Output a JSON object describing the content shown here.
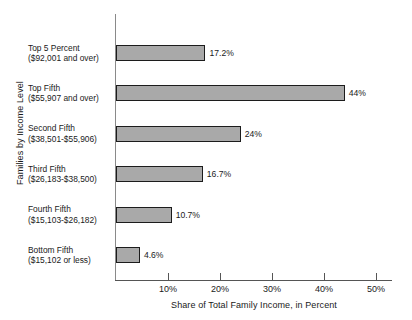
{
  "chart_data": {
    "type": "bar",
    "orientation": "horizontal",
    "title": "",
    "xlabel": "Share of Total Family Income, in Percent",
    "ylabel": "Families by Income Level",
    "xlim": [
      0,
      53
    ],
    "grid": false,
    "legend": "none",
    "xticks": [
      {
        "value": 10,
        "label": "10%"
      },
      {
        "value": 20,
        "label": "20%"
      },
      {
        "value": 30,
        "label": "30%"
      },
      {
        "value": 40,
        "label": "40%"
      },
      {
        "value": 50,
        "label": "50%"
      }
    ],
    "bar_color": "#a9a9a9",
    "bar_border_color": "#1c1c1c",
    "categories": [
      "Top 5 Percent ($92,001 and over)",
      "Top Fifth ($55,907 and over)",
      "Second Fifth ($38,501-$55,906)",
      "Third Fifth ($26,183-$38,500)",
      "Fourth Fifth ($15,103-$26,182)",
      "Bottom Fifth ($15,102 or less)"
    ],
    "values": [
      17.2,
      44,
      24,
      16.7,
      10.7,
      4.6
    ],
    "bars": [
      {
        "name": "Top 5 Percent",
        "label_line1": "Top 5 Percent",
        "label_line2": "($92,001 and over)",
        "value": 17.2,
        "value_label": "17.2%"
      },
      {
        "name": "Top Fifth",
        "label_line1": "Top Fifth",
        "label_line2": "($55,907 and over)",
        "value": 44,
        "value_label": "44%"
      },
      {
        "name": "Second Fifth",
        "label_line1": "Second Fifth",
        "label_line2": "($38,501-$55,906)",
        "value": 24,
        "value_label": "24%"
      },
      {
        "name": "Third Fifth",
        "label_line1": "Third Fifth",
        "label_line2": "($26,183-$38,500)",
        "value": 16.7,
        "value_label": "16.7%"
      },
      {
        "name": "Fourth Fifth",
        "label_line1": "Fourth Fifth",
        "label_line2": "($15,103-$26,182)",
        "value": 10.7,
        "value_label": "10.7%"
      },
      {
        "name": "Bottom Fifth",
        "label_line1": "Bottom Fifth",
        "label_line2": "($15,102 or less)",
        "value": 4.6,
        "value_label": "4.6%"
      }
    ]
  }
}
